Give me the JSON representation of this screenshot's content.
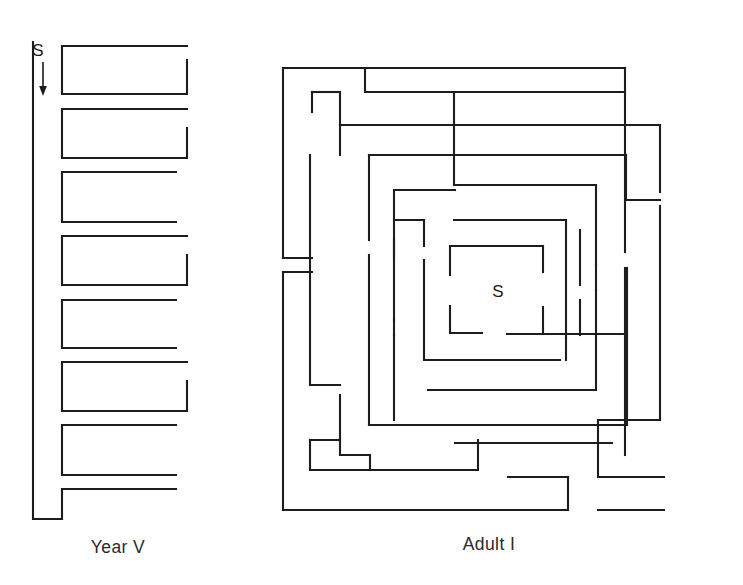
{
  "figure": {
    "background_color": "#ffffff",
    "ink_color": "#1d1d1d",
    "width": 743,
    "height": 585
  },
  "mazes": [
    {
      "id": "year-v",
      "caption": "Year V",
      "caption_x": 118,
      "caption_y": 553,
      "start_label": "S",
      "start_label_x": 44,
      "start_label_y": 55,
      "type": "serpentine",
      "arrow": {
        "x": 43,
        "y_top": 60,
        "y_bottom": 94
      },
      "geometry": {
        "spine_x": 33,
        "spine_top": 42,
        "spine_bottom": 519,
        "inner_x": 62,
        "right_long": 187,
        "right_short": 176,
        "rows": [
          {
            "top": 46,
            "bottom": 94,
            "right": 187,
            "closed": true
          },
          {
            "top": 109,
            "bottom": 158,
            "right": 176,
            "closed": true
          },
          {
            "top": 172,
            "bottom": 222,
            "right": 187,
            "closed": true
          },
          {
            "top": 236,
            "bottom": 285,
            "right": 176,
            "closed": true
          },
          {
            "top": 300,
            "bottom": 330,
            "right": 176,
            "closed": false
          },
          {
            "top": 334,
            "bottom": 384,
            "right": 187,
            "closed": true
          },
          {
            "top": 399,
            "bottom": 430,
            "right": 176,
            "closed": false
          },
          {
            "top": 443,
            "bottom": 475,
            "right": 176,
            "closed": false
          }
        ],
        "bottom_cap_x": 62,
        "bottom_cap_y": 519
      }
    },
    {
      "id": "adult-i",
      "caption": "Adult I",
      "caption_x": 489,
      "caption_y": 550,
      "start_label": "S",
      "start_label_x": 498,
      "start_label_y": 297,
      "type": "spiral",
      "geometry": {
        "outer": {
          "left": 283,
          "top": 68,
          "right": 625,
          "bottom": 510
        },
        "center": {
          "x": 460,
          "y": 290
        }
      }
    }
  ],
  "page_artifacts": {
    "bottom_edge_note": ""
  }
}
